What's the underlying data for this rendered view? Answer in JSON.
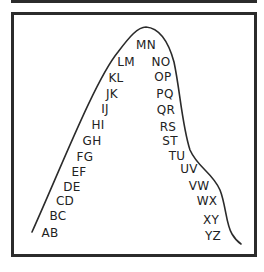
{
  "diagram": {
    "type": "bell-curve-letter-pairs",
    "colors": {
      "line": "#2b2b2b",
      "text": "#222222",
      "background": "#ffffff"
    },
    "left_labels": [
      {
        "text": "AB",
        "x": 50,
        "y": 233
      },
      {
        "text": "BC",
        "x": 58,
        "y": 216
      },
      {
        "text": "CD",
        "x": 65,
        "y": 201
      },
      {
        "text": "DE",
        "x": 72,
        "y": 187
      },
      {
        "text": "EF",
        "x": 79,
        "y": 172
      },
      {
        "text": "FG",
        "x": 85,
        "y": 157
      },
      {
        "text": "GH",
        "x": 92,
        "y": 141
      },
      {
        "text": "HI",
        "x": 98,
        "y": 125
      },
      {
        "text": "IJ",
        "x": 105,
        "y": 109
      },
      {
        "text": "JK",
        "x": 112,
        "y": 94
      },
      {
        "text": "KL",
        "x": 116,
        "y": 78
      },
      {
        "text": "LM",
        "x": 126,
        "y": 62
      }
    ],
    "peak_label": {
      "text": "MN",
      "x": 146,
      "y": 45
    },
    "right_labels": [
      {
        "text": "NO",
        "x": 161,
        "y": 62
      },
      {
        "text": "OP",
        "x": 163,
        "y": 77
      },
      {
        "text": "PQ",
        "x": 165,
        "y": 94
      },
      {
        "text": "QR",
        "x": 166,
        "y": 110
      },
      {
        "text": "RS",
        "x": 168,
        "y": 127
      },
      {
        "text": "ST",
        "x": 170,
        "y": 141
      },
      {
        "text": "TU",
        "x": 177,
        "y": 156
      },
      {
        "text": "UV",
        "x": 189,
        "y": 169
      },
      {
        "text": "VW",
        "x": 199,
        "y": 186
      },
      {
        "text": "WX",
        "x": 207,
        "y": 201
      },
      {
        "text": "XY",
        "x": 211,
        "y": 220
      },
      {
        "text": "YZ",
        "x": 213,
        "y": 236
      }
    ]
  }
}
